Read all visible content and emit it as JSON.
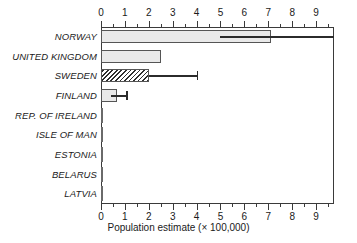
{
  "chart_data": {
    "type": "bar",
    "orientation": "horizontal",
    "title": "",
    "subtitle": "",
    "xlabel": "Population estimate (× 100,000)",
    "ylabel": "",
    "xlim": [
      0,
      9.75
    ],
    "xticks": [
      0,
      1,
      2,
      3,
      4,
      5,
      6,
      7,
      8,
      9
    ],
    "xtick_labels": [
      "0",
      "1",
      "2",
      "3",
      "4",
      "5",
      "6",
      "7",
      "8",
      "9"
    ],
    "minor_tick_step": 0.5,
    "grid": false,
    "legend": null,
    "axis_positions": [
      "top",
      "bottom"
    ],
    "categories": [
      "NORWAY",
      "UNITED KINGDOM",
      "SWEDEN",
      "FINLAND",
      "REP. OF IRELAND",
      "ISLE OF MAN",
      "ESTONIA",
      "BELARUS",
      "LATVIA"
    ],
    "values": [
      7.1,
      2.5,
      2.0,
      0.65,
      0.0,
      0.0,
      0.0,
      0.0,
      0.0
    ],
    "error_bars": [
      {
        "category": "NORWAY",
        "low": 5.0,
        "high": 9.75,
        "high_clipped": true
      },
      {
        "category": "UNITED KINGDOM",
        "low": null,
        "high": null
      },
      {
        "category": "SWEDEN",
        "low": 2.0,
        "high": 4.0
      },
      {
        "category": "FINLAND",
        "low": 0.4,
        "high": 1.05
      },
      {
        "category": "REP. OF IRELAND",
        "low": null,
        "high": null
      },
      {
        "category": "ISLE OF MAN",
        "low": null,
        "high": null
      },
      {
        "category": "ESTONIA",
        "low": null,
        "high": null
      },
      {
        "category": "BELARUS",
        "low": null,
        "high": null
      },
      {
        "category": "LATVIA",
        "low": null,
        "high": null
      }
    ],
    "bar_styles": [
      "solid-light-gray",
      "solid-light-gray",
      "diagonal-hatch",
      "solid-light-gray",
      "zero",
      "zero",
      "zero",
      "zero",
      "zero"
    ],
    "colors": {
      "bar_fill": "#e9e9e9",
      "bar_edge": "#555555",
      "hatch": "#2e2e2e",
      "error_bar": "#2b2b2b",
      "axis": "#3a3a3a",
      "text": "#1a1a1a",
      "background": "#ffffff"
    }
  }
}
